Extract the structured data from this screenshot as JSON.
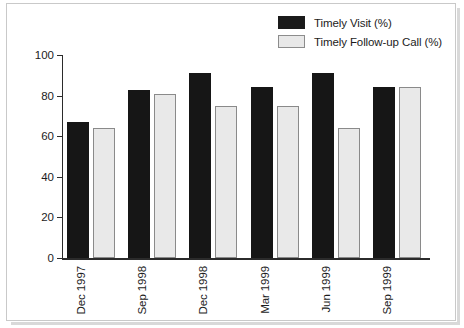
{
  "chart_data": {
    "type": "bar",
    "title": "",
    "xlabel": "",
    "ylabel": "Percentage f Timely Visits and Follow-up Calls",
    "ylim": [
      0,
      100
    ],
    "yticks": [
      0,
      20,
      40,
      60,
      80,
      100
    ],
    "grid": false,
    "legend_position": "top-right",
    "categories": [
      "Dec 1997",
      "Sep 1998",
      "Dec 1998",
      "Mar 1999",
      "Jun 1999",
      "Sep 1999"
    ],
    "series": [
      {
        "name": "Timely Visit (%)",
        "color": "#161616",
        "values": [
          67,
          83,
          91,
          84,
          91,
          84
        ]
      },
      {
        "name": "Timely Follow-up Call (%)",
        "color": "#e9e9e9",
        "values": [
          64,
          81,
          75,
          75,
          64,
          84
        ]
      }
    ]
  },
  "legend": {
    "items": [
      {
        "label": "Timely Visit (%)",
        "swatch": "visit"
      },
      {
        "label": "Timely Follow-up Call (%)",
        "swatch": "call"
      }
    ]
  },
  "axes": {
    "y_title": "Percentage f Timely Visits and Follow-up Calls",
    "y_tick_labels": [
      "100",
      "80",
      "60",
      "40",
      "20",
      "0"
    ],
    "x_tick_labels": [
      "Dec 1997",
      "Sep 1998",
      "Dec 1998",
      "Mar 1999",
      "Jun 1999",
      "Sep 1999"
    ]
  }
}
